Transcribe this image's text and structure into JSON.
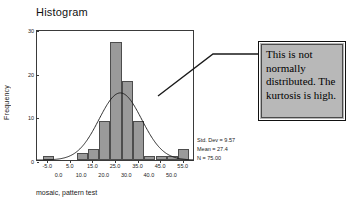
{
  "chart_data": {
    "type": "bar",
    "title": "Histogram",
    "xlabel": "mosaic, pattern test",
    "ylabel": "Frequency",
    "ylim": [
      0,
      30
    ],
    "xlim": [
      -10,
      60
    ],
    "grid": false,
    "bin_width": 5,
    "categories": [
      "-5.0",
      "0.0",
      "5.0",
      "10.0",
      "15.0",
      "20.0",
      "25.0",
      "30.0",
      "35.0",
      "40.0",
      "45.0",
      "50.0",
      "55.0"
    ],
    "bin_centers": [
      -5,
      0,
      5,
      10,
      15,
      20,
      25,
      30,
      35,
      40,
      45,
      50,
      55
    ],
    "values": [
      1,
      0,
      0,
      1.5,
      2.5,
      9,
      27,
      18,
      9,
      1,
      1,
      1,
      2.5
    ],
    "y_ticks": [
      "0",
      "10",
      "20",
      "30"
    ],
    "y_tick_values": [
      0,
      10,
      20,
      30
    ],
    "x_ticks_row1": [
      "-5.0",
      "5.0",
      "15.0",
      "25.0",
      "35.0",
      "45.0",
      "55.0"
    ],
    "x_tick_values_row1": [
      -5,
      5,
      15,
      25,
      35,
      45,
      55
    ],
    "x_ticks_row2": [
      "0.0",
      "10.0",
      "20.0",
      "30.0",
      "40.0",
      "50.0"
    ],
    "x_tick_values_row2": [
      0,
      10,
      20,
      30,
      40,
      50
    ],
    "overlay_curve": {
      "name": "normal-curve",
      "mean": 27.4,
      "std_dev": 9.57,
      "n": 75,
      "peak_frequency": 15.6
    },
    "series": [
      {
        "name": "Frequency",
        "values": [
          1,
          0,
          0,
          1.5,
          2.5,
          9,
          27,
          18,
          9,
          1,
          1,
          1,
          2.5
        ]
      }
    ],
    "bar_color": "#9a9a9a",
    "bar_edge_color": "#4d4d4d",
    "curve_color": "#1a1a1a"
  },
  "stats": {
    "std_dev": "Std. Dev = 9.57",
    "mean": "Mean = 27.4",
    "n": "N = 75.00"
  },
  "callout": {
    "text": "This is not normally distributed. The kurtosis is high.",
    "background": "#b6b6b6",
    "border_color": "#111111"
  },
  "annotation": {
    "leader_line": "polyline-elbow"
  }
}
